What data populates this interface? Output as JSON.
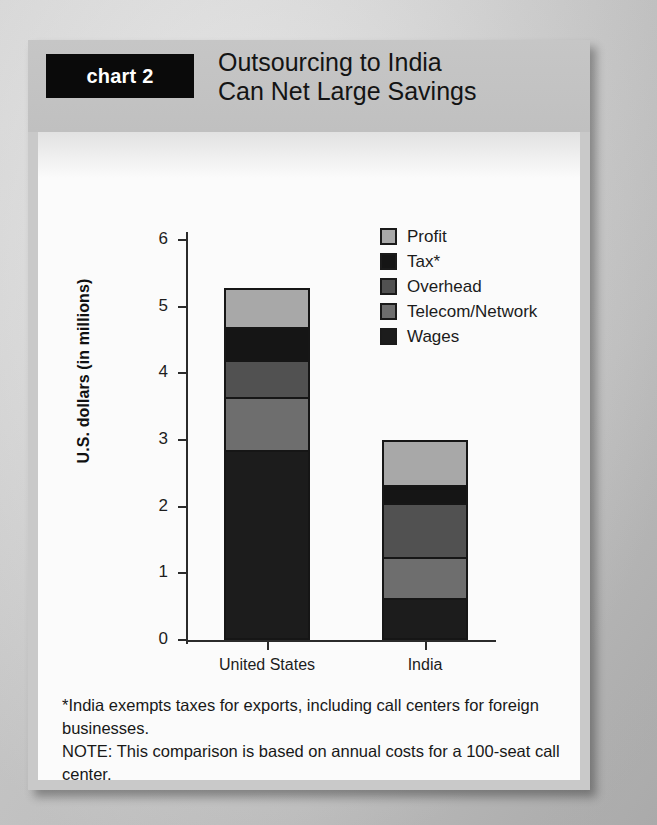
{
  "header": {
    "tag": "chart 2",
    "title_line1": "Outsourcing to India",
    "title_line2": "Can Net Large Savings"
  },
  "notes": {
    "footnote": "*India exempts taxes for exports, including call centers for foreign businesses.",
    "note": "NOTE: This comparison is based on annual costs for a 100-seat call center."
  },
  "chart_data": {
    "type": "bar",
    "stacked": true,
    "title": "Outsourcing to India Can Net Large Savings",
    "xlabel": "",
    "ylabel": "U.S. dollars (in millions)",
    "ylim": [
      0,
      6.4
    ],
    "yticks": [
      0,
      1,
      2,
      3,
      4,
      5,
      6
    ],
    "ytick_labels": [
      "0",
      "1",
      "2",
      "3",
      "4",
      "5",
      "6"
    ],
    "grid": false,
    "legend_position": "upper right",
    "legend_order_top_to_bottom": [
      "Profit",
      "Tax*",
      "Overhead",
      "Telecom/Network",
      "Wages"
    ],
    "categories": [
      "United States",
      "India"
    ],
    "series": [
      {
        "name": "Wages",
        "color": "#1c1c1c",
        "values": [
          2.85,
          0.63
        ]
      },
      {
        "name": "Telecom/Network",
        "color": "#6e6e6e",
        "values": [
          0.8,
          0.62
        ]
      },
      {
        "name": "Overhead",
        "color": "#515151",
        "values": [
          0.55,
          0.8
        ]
      },
      {
        "name": "Tax*",
        "color": "#151515",
        "values": [
          0.5,
          0.28
        ]
      },
      {
        "name": "Profit",
        "color": "#a8a8a8",
        "values": [
          0.58,
          0.67
        ]
      }
    ],
    "totals": [
      5.28,
      3.0
    ]
  }
}
